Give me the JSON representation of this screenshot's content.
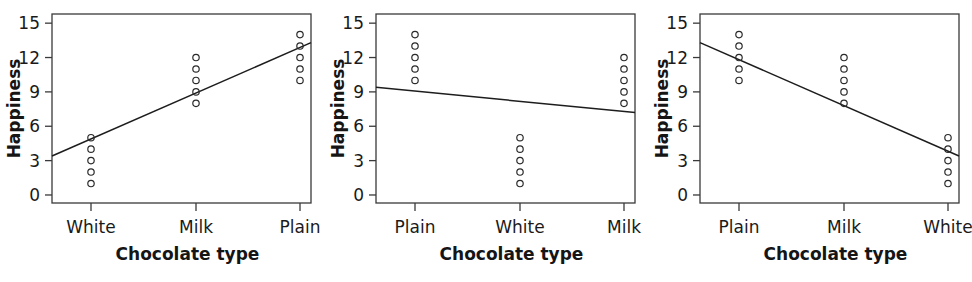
{
  "figure": {
    "width": 972,
    "height": 282,
    "background": "#ffffff",
    "ink_color": "#1a1a1a"
  },
  "chart_data": [
    {
      "type": "scatter",
      "panel_index": 1,
      "panel_name": "panel-ascending",
      "title": "",
      "xlabel": "Chocolate type",
      "ylabel": "Happiness",
      "categories": [
        "White",
        "Milk",
        "Plain"
      ],
      "xtick_labels": [
        "White",
        "Milk",
        "Plain"
      ],
      "ytick_labels": [
        "0",
        "3",
        "6",
        "9",
        "12",
        "15"
      ],
      "yticks": [
        0,
        3,
        6,
        9,
        12,
        15
      ],
      "ylim": [
        -0.7,
        15.8
      ],
      "grid": false,
      "legend": false,
      "series": [
        {
          "name": "White",
          "x_category": "White",
          "values": [
            5,
            4,
            3,
            2,
            1
          ]
        },
        {
          "name": "Milk",
          "x_category": "Milk",
          "values": [
            12,
            11,
            10,
            9,
            8
          ]
        },
        {
          "name": "Plain",
          "x_category": "Plain",
          "values": [
            14,
            13,
            12,
            11,
            10
          ]
        }
      ],
      "fit_line": {
        "label": "regression-line",
        "x_start_category": "left-edge",
        "x_end_category": "right-edge",
        "y_start": 3.4,
        "y_end": 13.3,
        "slope_direction": "positive"
      }
    },
    {
      "type": "scatter",
      "panel_index": 2,
      "panel_name": "panel-flat",
      "title": "",
      "xlabel": "Chocolate type",
      "ylabel": "Happiness",
      "categories": [
        "Plain",
        "White",
        "Milk"
      ],
      "xtick_labels": [
        "Plain",
        "White",
        "Milk"
      ],
      "ytick_labels": [
        "0",
        "3",
        "6",
        "9",
        "12",
        "15"
      ],
      "yticks": [
        0,
        3,
        6,
        9,
        12,
        15
      ],
      "ylim": [
        -0.7,
        15.8
      ],
      "grid": false,
      "legend": false,
      "series": [
        {
          "name": "Plain",
          "x_category": "Plain",
          "values": [
            14,
            13,
            12,
            11,
            10
          ]
        },
        {
          "name": "White",
          "x_category": "White",
          "values": [
            5,
            4,
            3,
            2,
            1
          ]
        },
        {
          "name": "Milk",
          "x_category": "Milk",
          "values": [
            12,
            11,
            10,
            9,
            8
          ]
        }
      ],
      "fit_line": {
        "label": "regression-line",
        "x_start_category": "left-edge",
        "x_end_category": "right-edge",
        "y_start": 9.4,
        "y_end": 7.2,
        "slope_direction": "slightly-negative"
      }
    },
    {
      "type": "scatter",
      "panel_index": 3,
      "panel_name": "panel-descending",
      "title": "",
      "xlabel": "Chocolate type",
      "ylabel": "Happiness",
      "categories": [
        "Plain",
        "Milk",
        "White"
      ],
      "xtick_labels": [
        "Plain",
        "Milk",
        "White"
      ],
      "ytick_labels": [
        "0",
        "3",
        "6",
        "9",
        "12",
        "15"
      ],
      "yticks": [
        0,
        3,
        6,
        9,
        12,
        15
      ],
      "ylim": [
        -0.7,
        15.8
      ],
      "grid": false,
      "legend": false,
      "series": [
        {
          "name": "Plain",
          "x_category": "Plain",
          "values": [
            14,
            13,
            12,
            11,
            10
          ]
        },
        {
          "name": "Milk",
          "x_category": "Milk",
          "values": [
            12,
            11,
            10,
            9,
            8
          ]
        },
        {
          "name": "White",
          "x_category": "White",
          "values": [
            5,
            4,
            3,
            2,
            1
          ]
        }
      ],
      "fit_line": {
        "label": "regression-line",
        "x_start_category": "left-edge",
        "x_end_category": "right-edge",
        "y_start": 13.3,
        "y_end": 3.4,
        "slope_direction": "negative"
      }
    }
  ]
}
